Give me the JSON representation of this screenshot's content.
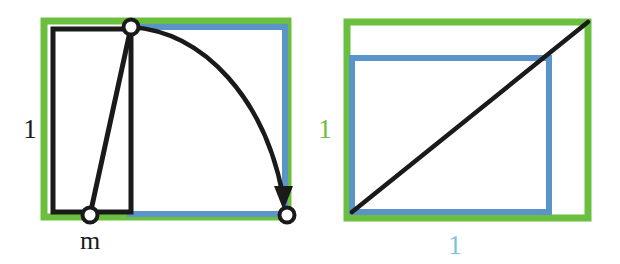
{
  "figure": {
    "background": "#ffffff",
    "colors": {
      "green": "#6abf3f",
      "blue": "#5b94c8",
      "blue_label": "#7dc3e0",
      "black": "#1a1a1a",
      "white": "#ffffff"
    },
    "panels": [
      {
        "name": "left-panel",
        "green_rect": {
          "x": 44,
          "y": 21,
          "w": 244,
          "h": 196,
          "stroke_width": 7
        },
        "blue_rect": {
          "x": 130,
          "y": 27,
          "w": 155,
          "h": 187,
          "stroke_width": 6
        },
        "black_rect": {
          "x": 53,
          "y": 29,
          "w": 78,
          "h": 183,
          "stroke_width": 5
        },
        "chord": {
          "x1": 131,
          "y1": 27,
          "x2": 90,
          "y2": 215
        },
        "arc": {
          "x1": 131,
          "y1": 27,
          "x2": 287,
          "y2": 215,
          "bulge": "outward"
        },
        "nodes": [
          {
            "name": "apex-node",
            "cx": 131,
            "cy": 27,
            "r": 7
          },
          {
            "name": "m-node",
            "cx": 90,
            "cy": 215,
            "r": 7
          },
          {
            "name": "arrow-target-node",
            "cx": 287,
            "cy": 215,
            "r": 7
          }
        ],
        "labels": [
          {
            "name": "height-label-one",
            "text": "1",
            "x": 30,
            "y": 132,
            "color": "#1a1a1a",
            "size": 27
          },
          {
            "name": "base-label-m",
            "text": "m",
            "x": 90,
            "y": 243,
            "color": "#1a1a1a",
            "size": 24
          }
        ]
      },
      {
        "name": "right-panel",
        "green_rect": {
          "x": 347,
          "y": 22,
          "w": 241,
          "h": 196,
          "stroke_width": 7
        },
        "blue_rect": {
          "x": 352,
          "y": 58,
          "w": 197,
          "h": 154,
          "stroke_width": 6
        },
        "diagonal": {
          "x1": 352,
          "y1": 212,
          "x2": 588,
          "y2": 22
        },
        "labels": [
          {
            "name": "height-label-one-green",
            "text": "1",
            "x": 325,
            "y": 132,
            "color": "#6abf3f",
            "size": 27
          },
          {
            "name": "width-label-one-blue",
            "text": "1",
            "x": 455,
            "y": 250,
            "color": "#7dc3e0",
            "size": 27
          }
        ]
      }
    ]
  }
}
